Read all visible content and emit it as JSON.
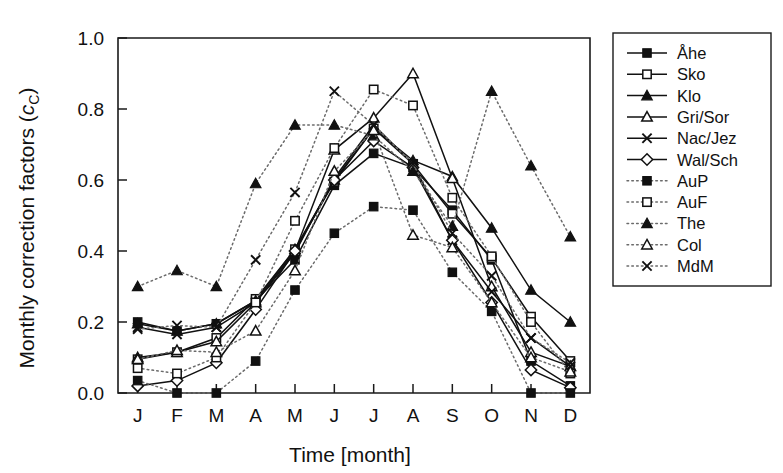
{
  "figure": {
    "background": "#ffffff",
    "ink_color": "#111111",
    "dotted_color": "#6b6b6b"
  },
  "chart_data": {
    "type": "line",
    "title": "",
    "subtitle": "",
    "xlabel": "Time [month]",
    "ylabel": "Monthly correction factors (cC)",
    "ylabel_main": "Monthly correction factors (",
    "ylabel_italic": "c",
    "ylabel_sub": "C",
    "ylabel_close": ")",
    "categories": [
      "J",
      "F",
      "M",
      "A",
      "M",
      "J",
      "J",
      "A",
      "S",
      "O",
      "N",
      "D"
    ],
    "x": [
      1,
      2,
      3,
      4,
      5,
      6,
      7,
      8,
      9,
      10,
      11,
      12
    ],
    "xtick_labels": [
      "J",
      "F",
      "M",
      "A",
      "M",
      "J",
      "J",
      "A",
      "S",
      "O",
      "N",
      "D"
    ],
    "ytick_labels": [
      "0.0",
      "0.2",
      "0.4",
      "0.6",
      "0.8",
      "1.0"
    ],
    "yticks": [
      0.0,
      0.2,
      0.4,
      0.6,
      0.8,
      1.0
    ],
    "ylim": [
      0.0,
      1.0
    ],
    "xlim": [
      0.5,
      12.5
    ],
    "grid": false,
    "legend_position": "right-outside",
    "series": [
      {
        "name": "Åhe",
        "marker": "filled-square",
        "linestyle": "solid",
        "values": [
          0.2,
          0.175,
          0.195,
          0.26,
          0.375,
          0.585,
          0.675,
          0.635,
          0.515,
          0.375,
          0.09,
          0.02
        ]
      },
      {
        "name": "Sko",
        "marker": "open-square",
        "linestyle": "solid",
        "values": [
          0.095,
          0.115,
          0.155,
          0.265,
          0.405,
          0.595,
          0.745,
          0.645,
          0.505,
          0.38,
          0.215,
          0.09
        ]
      },
      {
        "name": "Klo",
        "marker": "filled-triangle",
        "linestyle": "solid",
        "values": [
          0.195,
          0.175,
          0.195,
          0.26,
          0.405,
          0.6,
          0.745,
          0.655,
          0.61,
          0.465,
          0.29,
          0.2
        ]
      },
      {
        "name": "Gri/Sor",
        "marker": "open-triangle",
        "linestyle": "solid",
        "values": [
          0.1,
          0.115,
          0.145,
          0.255,
          0.4,
          0.685,
          0.775,
          0.9,
          0.605,
          0.3,
          0.115,
          0.075
        ]
      },
      {
        "name": "Nac/Jez",
        "marker": "x-cross",
        "linestyle": "solid",
        "values": [
          0.185,
          0.165,
          0.185,
          0.255,
          0.395,
          0.605,
          0.755,
          0.645,
          0.43,
          0.285,
          0.155,
          0.075
        ]
      },
      {
        "name": "Wal/Sch",
        "marker": "open-diamond",
        "linestyle": "solid",
        "values": [
          0.02,
          0.035,
          0.085,
          0.235,
          0.4,
          0.6,
          0.71,
          0.635,
          0.43,
          0.255,
          0.065,
          0.015
        ]
      },
      {
        "name": "AuP",
        "marker": "filled-square",
        "linestyle": "dotted",
        "values": [
          0.035,
          0.0,
          0.0,
          0.09,
          0.29,
          0.45,
          0.525,
          0.515,
          0.34,
          0.23,
          0.0,
          0.0
        ]
      },
      {
        "name": "AuF",
        "marker": "open-square",
        "linestyle": "dotted",
        "values": [
          0.07,
          0.055,
          0.1,
          0.255,
          0.485,
          0.69,
          0.855,
          0.81,
          0.55,
          0.385,
          0.2,
          0.055
        ]
      },
      {
        "name": "The",
        "marker": "filled-triangle",
        "linestyle": "dotted",
        "values": [
          0.3,
          0.345,
          0.3,
          0.59,
          0.755,
          0.755,
          0.725,
          0.625,
          0.47,
          0.85,
          0.64,
          0.44
        ]
      },
      {
        "name": "Col",
        "marker": "open-triangle",
        "linestyle": "dotted",
        "values": [
          0.095,
          0.12,
          0.115,
          0.175,
          0.345,
          0.625,
          0.74,
          0.445,
          0.41,
          0.255,
          0.1,
          0.06
        ]
      },
      {
        "name": "MdM",
        "marker": "x-cross",
        "linestyle": "dotted",
        "values": [
          0.18,
          0.19,
          0.185,
          0.375,
          0.565,
          0.85,
          0.755,
          0.645,
          0.45,
          0.33,
          0.155,
          0.085
        ]
      }
    ]
  },
  "legend": {
    "items": [
      {
        "label": "Åhe",
        "marker": "filled-square",
        "linestyle": "solid"
      },
      {
        "label": "Sko",
        "marker": "open-square",
        "linestyle": "solid"
      },
      {
        "label": "Klo",
        "marker": "filled-triangle",
        "linestyle": "solid"
      },
      {
        "label": "Gri/Sor",
        "marker": "open-triangle",
        "linestyle": "solid"
      },
      {
        "label": "Nac/Jez",
        "marker": "x-cross",
        "linestyle": "solid"
      },
      {
        "label": "Wal/Sch",
        "marker": "open-diamond",
        "linestyle": "solid"
      },
      {
        "label": "AuP",
        "marker": "filled-square",
        "linestyle": "dotted"
      },
      {
        "label": "AuF",
        "marker": "open-square",
        "linestyle": "dotted"
      },
      {
        "label": "The",
        "marker": "filled-triangle",
        "linestyle": "dotted"
      },
      {
        "label": "Col",
        "marker": "open-triangle",
        "linestyle": "dotted"
      },
      {
        "label": "MdM",
        "marker": "x-cross",
        "linestyle": "dotted"
      }
    ]
  }
}
